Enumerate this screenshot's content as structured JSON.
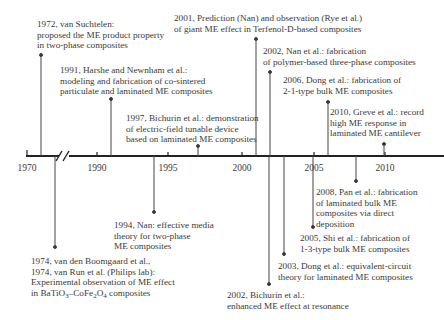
{
  "diagram": {
    "type": "timeline",
    "title": "",
    "axis": {
      "ticks": [
        "1970",
        "1990",
        "1995",
        "2000",
        "2005",
        "2010"
      ],
      "break_between": [
        "1970",
        "1990"
      ]
    },
    "events_above": [
      {
        "year": "1972",
        "lines": [
          "1972, van Suchtelen:",
          "proposed the ME product property",
          "in two-phase composites"
        ]
      },
      {
        "year": "1991",
        "lines": [
          "1991, Harshe and Newnham et al.:",
          "modeling and fabrication of co-sintered",
          "particulate and laminated ME composites"
        ]
      },
      {
        "year": "1997",
        "lines": [
          "1997, Bichurin et al.: demonstration",
          "of electric-field tunable device",
          "based on laminated ME composites"
        ]
      },
      {
        "year": "2001",
        "lines": [
          "2001, Prediction (Nan) and observation (Rye et al.)",
          "of giant ME effect in Terfenol-D-based composites"
        ]
      },
      {
        "year": "2002",
        "lines": [
          "2002, Nan et al.: fabrication",
          "of polymer-based three-phase composites"
        ]
      },
      {
        "year": "2006",
        "lines": [
          "2006, Dong et al.: fabrication of",
          "2-1-type bulk ME composites"
        ]
      },
      {
        "year": "2010",
        "lines": [
          "2010, Greve et al.: record",
          "high ME response in",
          "laminated ME cantilever"
        ]
      }
    ],
    "events_below": [
      {
        "year": "1974",
        "lines": [
          "1974, van den Boomgaard et al.,",
          "1974, van Run et al. (Philips lab):",
          "Experimental observation of ME effect"
        ],
        "formula_line": {
          "prefix": "in BaTiO",
          "sub1": "3",
          "mid": "–CoFe",
          "sub2": "2",
          "mid2": "O",
          "sub3": "4",
          "suffix": " composites"
        }
      },
      {
        "year": "1994",
        "lines": [
          "1994, Nan: effective media",
          "theory for two-phase",
          "ME composites"
        ]
      },
      {
        "year": "2002b",
        "lines": [
          "2002, Bichurin et al.:",
          "enhanced ME effect at resonance"
        ]
      },
      {
        "year": "2003",
        "lines": [
          "2003, Dong et al.: equivalent-circuit",
          "theory for laminated ME composites"
        ]
      },
      {
        "year": "2005",
        "lines": [
          "2005, Shi et al.: fabrication of",
          "1-3-type bulk ME composites"
        ]
      },
      {
        "year": "2008",
        "lines": [
          "2008, Pan et al.: fabrication",
          "of laminated bulk ME",
          "composites via direct",
          "deposition"
        ]
      }
    ]
  }
}
